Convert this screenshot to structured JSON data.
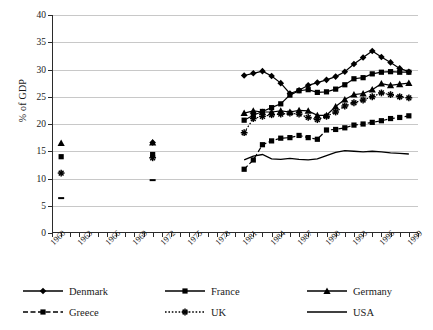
{
  "chart_data": {
    "type": "line",
    "title": "",
    "xlabel": "",
    "ylabel": "% of GDP",
    "xlim": [
      1960,
      2000
    ],
    "ylim": [
      0,
      40
    ],
    "ytick_labels": [
      "0",
      "5",
      "10",
      "15",
      "20",
      "25",
      "30",
      "35",
      "40"
    ],
    "ytick_values": [
      0,
      5,
      10,
      15,
      20,
      25,
      30,
      35,
      40
    ],
    "xtick_labels": [
      "1960",
      "1963",
      "1966",
      "1969",
      "1972",
      "1975",
      "1978",
      "1981",
      "1984",
      "1987",
      "1990",
      "1993",
      "1996",
      "1999"
    ],
    "xtick_values": [
      1960,
      1963,
      1966,
      1969,
      1972,
      1975,
      1978,
      1981,
      1984,
      1987,
      1990,
      1993,
      1996,
      1999
    ],
    "grid": "horizontal",
    "legend_position": "bottom",
    "series": [
      {
        "name": "Denmark",
        "marker": "diamond",
        "line": "solid",
        "color": "#000000",
        "x": [
          1971,
          1981,
          1982,
          1983,
          1984,
          1985,
          1986,
          1987,
          1988,
          1989,
          1990,
          1991,
          1992,
          1993,
          1994,
          1995,
          1996,
          1997,
          1998,
          1999
        ],
        "y": [
          16.6,
          28.9,
          29.3,
          29.7,
          28.8,
          27.5,
          25.6,
          26.2,
          27.1,
          27.6,
          28.1,
          28.7,
          29.6,
          31.0,
          32.2,
          33.4,
          32.3,
          31.3,
          30.2,
          29.6
        ]
      },
      {
        "name": "France",
        "marker": "square",
        "line": "solid",
        "color": "#000000",
        "x": [
          1961,
          1971,
          1981,
          1982,
          1983,
          1984,
          1985,
          1986,
          1987,
          1988,
          1989,
          1990,
          1991,
          1992,
          1993,
          1994,
          1995,
          1996,
          1997,
          1998,
          1999
        ],
        "y": [
          14.0,
          14.4,
          20.7,
          21.6,
          22.3,
          23.0,
          23.7,
          25.3,
          26.1,
          26.3,
          25.8,
          25.9,
          26.4,
          27.2,
          28.3,
          28.5,
          29.2,
          29.5,
          29.6,
          29.5,
          29.5
        ]
      },
      {
        "name": "Germany",
        "marker": "triangle",
        "line": "solid",
        "color": "#000000",
        "x": [
          1961,
          1971,
          1981,
          1982,
          1983,
          1984,
          1985,
          1986,
          1987,
          1988,
          1989,
          1990,
          1991,
          1992,
          1993,
          1994,
          1995,
          1996,
          1997,
          1998,
          1999
        ],
        "y": [
          16.5,
          16.6,
          22.0,
          22.4,
          22.2,
          22.2,
          22.4,
          22.2,
          22.5,
          22.4,
          21.6,
          21.6,
          23.2,
          24.5,
          25.4,
          25.6,
          26.3,
          27.4,
          27.1,
          27.3,
          27.5
        ]
      },
      {
        "name": "Greece",
        "marker": "square",
        "line": "dashed",
        "color": "#000000",
        "x": [
          1981,
          1982,
          1983,
          1984,
          1985,
          1986,
          1987,
          1988,
          1989,
          1990,
          1991,
          1992,
          1993,
          1994,
          1995,
          1996,
          1997,
          1998,
          1999
        ],
        "y": [
          11.7,
          13.4,
          16.2,
          16.9,
          17.4,
          17.5,
          17.9,
          17.5,
          17.2,
          18.9,
          19.0,
          19.3,
          19.8,
          20.0,
          20.3,
          20.6,
          21.0,
          21.2,
          21.5
        ]
      },
      {
        "name": "UK",
        "marker": "asterisk",
        "line": "dotted",
        "color": "#000000",
        "x": [
          1961,
          1971,
          1981,
          1982,
          1983,
          1984,
          1985,
          1986,
          1987,
          1988,
          1989,
          1990,
          1991,
          1992,
          1993,
          1994,
          1995,
          1996,
          1997,
          1998,
          1999
        ],
        "y": [
          11.0,
          13.8,
          18.4,
          21.0,
          21.4,
          21.7,
          21.8,
          22.0,
          21.8,
          21.2,
          20.8,
          21.4,
          22.2,
          23.3,
          23.9,
          24.4,
          25.0,
          25.7,
          25.4,
          25.0,
          24.8
        ]
      },
      {
        "name": "USA",
        "marker": "none",
        "line": "solid",
        "color": "#000000",
        "x": [
          1961,
          1971,
          1981,
          1982,
          1983,
          1984,
          1985,
          1986,
          1987,
          1988,
          1989,
          1990,
          1991,
          1992,
          1993,
          1994,
          1995,
          1996,
          1997,
          1998,
          1999
        ],
        "y": [
          6.4,
          9.7,
          13.4,
          14.1,
          14.4,
          13.6,
          13.5,
          13.7,
          13.5,
          13.4,
          13.6,
          14.2,
          14.8,
          15.1,
          15.0,
          14.9,
          15.0,
          14.9,
          14.7,
          14.6,
          14.5
        ]
      }
    ]
  },
  "legend": {
    "rows": [
      [
        {
          "label": "Denmark",
          "marker": "diamond",
          "line": "solid"
        },
        {
          "label": "France",
          "marker": "square",
          "line": "solid"
        },
        {
          "label": "Germany",
          "marker": "triangle",
          "line": "solid"
        }
      ],
      [
        {
          "label": "Greece",
          "marker": "square",
          "line": "dashed"
        },
        {
          "label": "UK",
          "marker": "asterisk",
          "line": "dotted"
        },
        {
          "label": "USA",
          "marker": "none",
          "line": "solid"
        }
      ]
    ]
  }
}
